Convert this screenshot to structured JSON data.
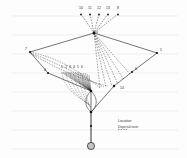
{
  "figure": {
    "title": "",
    "background_color": "#fdfdfd",
    "ink_color": "#1a1a1a",
    "gridline_color": "#e2e2e2",
    "width": 187,
    "height": 158
  },
  "grid": {
    "visible": true,
    "orientation": "horizontal",
    "line_y": [
      16,
      35,
      54,
      73,
      92,
      111,
      130,
      149
    ],
    "x_start": 12,
    "x_end": 178
  },
  "top_labels": [
    {
      "text": "10",
      "x": 79,
      "y": 9
    },
    {
      "text": "11",
      "x": 88,
      "y": 9
    },
    {
      "text": "12",
      "x": 97,
      "y": 9
    },
    {
      "text": "13",
      "x": 106,
      "y": 9
    },
    {
      "text": "8",
      "x": 117,
      "y": 9
    }
  ],
  "side_labels": [
    {
      "text": "7",
      "x": 25,
      "y": 50
    },
    {
      "text": "5",
      "x": 160,
      "y": 51
    },
    {
      "text": "4",
      "x": 44,
      "y": 72
    },
    {
      "text": "6",
      "x": 135,
      "y": 71
    },
    {
      "text": "14",
      "x": 122,
      "y": 89
    },
    {
      "text": "9",
      "x": 96,
      "y": 34
    }
  ],
  "cluster_labels": [
    {
      "text": "1",
      "x": 62,
      "y": 69
    },
    {
      "text": "2",
      "x": 66,
      "y": 69
    },
    {
      "text": "3",
      "x": 70,
      "y": 69
    },
    {
      "text": "4",
      "x": 74,
      "y": 69
    },
    {
      "text": "5",
      "x": 78,
      "y": 69
    },
    {
      "text": "6",
      "x": 82,
      "y": 69
    }
  ],
  "legend": {
    "title": "Location",
    "subtitle": "Dispersal route"
  },
  "nodes": {
    "hub_top": {
      "x": 94,
      "y": 33,
      "kind": "filled"
    },
    "left": {
      "x": 30,
      "y": 52,
      "kind": "filled"
    },
    "right": {
      "x": 157,
      "y": 53,
      "kind": "filled"
    },
    "lower_left": {
      "x": 48,
      "y": 73,
      "kind": "filled"
    },
    "lower_right": {
      "x": 132,
      "y": 72,
      "kind": "filled"
    },
    "junction": {
      "x": 114,
      "y": 86,
      "kind": "filled"
    },
    "fan_center": {
      "x": 91,
      "y": 91,
      "kind": "filled"
    },
    "base": {
      "x": 91,
      "y": 112,
      "kind": "filled"
    },
    "stem_mid": {
      "x": 91,
      "y": 126,
      "kind": "filled"
    },
    "root": {
      "x": 91,
      "y": 146,
      "kind": "hatched-circle"
    }
  },
  "line_styles": {
    "solid": "solid",
    "dashed": "dashed"
  }
}
